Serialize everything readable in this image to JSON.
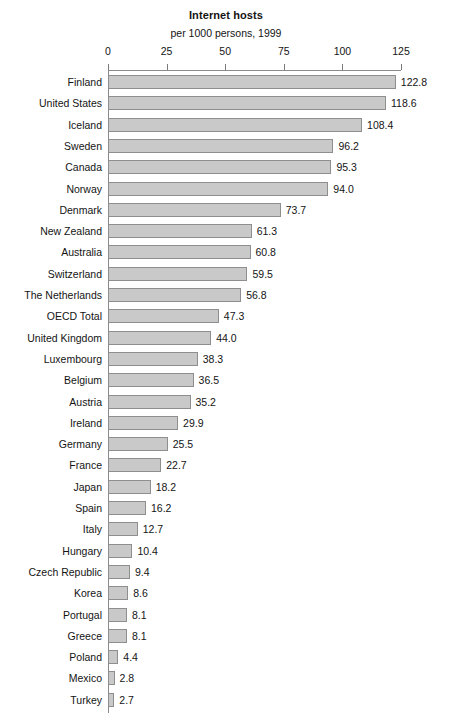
{
  "chart_data": {
    "type": "bar",
    "orientation": "horizontal",
    "title": "Internet hosts",
    "subtitle": "per 1000 persons, 1999",
    "xlabel": "",
    "ylabel": "",
    "xlim": [
      0,
      125
    ],
    "grid": false,
    "legend": "none",
    "xticks": [
      "0",
      "25",
      "50",
      "75",
      "100",
      "125"
    ],
    "xtick_values": [
      0,
      25,
      50,
      75,
      100,
      125
    ],
    "bar_color": "#c9c9c9",
    "bar_border_color": "#8e8e8e",
    "categories": [
      "Finland",
      "United States",
      "Iceland",
      "Sweden",
      "Canada",
      "Norway",
      "Denmark",
      "New Zealand",
      "Australia",
      "Switzerland",
      "The Netherlands",
      "OECD Total",
      "United Kingdom",
      "Luxembourg",
      "Belgium",
      "Austria",
      "Ireland",
      "Germany",
      "France",
      "Japan",
      "Spain",
      "Italy",
      "Hungary",
      "Czech Republic",
      "Korea",
      "Portugal",
      "Greece",
      "Poland",
      "Mexico",
      "Turkey"
    ],
    "values": [
      122.8,
      118.6,
      108.4,
      96.2,
      95.3,
      94.0,
      73.7,
      61.3,
      60.8,
      59.5,
      56.8,
      47.3,
      44.0,
      38.3,
      36.5,
      35.2,
      29.9,
      25.5,
      22.7,
      18.2,
      16.2,
      12.7,
      10.4,
      9.4,
      8.6,
      8.1,
      8.1,
      4.4,
      2.8,
      2.7
    ],
    "value_labels": [
      "122.8",
      "118.6",
      "108.4",
      "96.2",
      "95.3",
      "94.0",
      "73.7",
      "61.3",
      "60.8",
      "59.5",
      "56.8",
      "47.3",
      "44.0",
      "38.3",
      "36.5",
      "35.2",
      "29.9",
      "25.5",
      "22.7",
      "18.2",
      "16.2",
      "12.7",
      "10.4",
      "9.4",
      "8.6",
      "8.1",
      "8.1",
      "4.4",
      "2.8",
      "2.7"
    ]
  }
}
